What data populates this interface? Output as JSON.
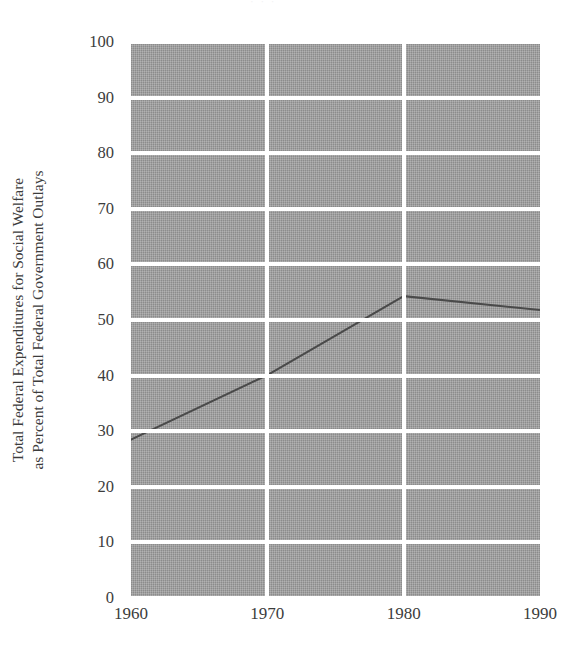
{
  "page": {
    "bleed_text": "· · ·"
  },
  "chart_data": {
    "type": "line",
    "title": "",
    "subtitle": "",
    "xlabel": "",
    "ylabel": "Total Federal Expenditures for Social Welfare as Percent of Total Federal Government Outlays",
    "ylabel_lines": [
      "Total Federal Expenditures for Social Welfare",
      "as Percent of Total Federal Government Outlays"
    ],
    "x": [
      1960,
      1970,
      1980,
      1990
    ],
    "xtick_labels": [
      "1960",
      "1970",
      "1980",
      "1990"
    ],
    "xlim": [
      1960,
      1990
    ],
    "values": [
      28.5,
      40.1,
      54.3,
      51.8
    ],
    "ylim": [
      0,
      100
    ],
    "yticks": [
      100,
      90,
      80,
      70,
      60,
      50,
      40,
      30,
      20,
      10,
      0
    ],
    "ytick_labels": [
      "100",
      "90",
      "80",
      "70",
      "60",
      "50",
      "40",
      "30",
      "20",
      "10",
      "0"
    ],
    "grid": "horizontal-and-vertical",
    "grid_color": "#ffffff",
    "plot_background": "#9b9b9b",
    "series_color": "#4a4a4a",
    "legend": "none",
    "annotations": [],
    "series": [
      {
        "name": "Total Federal Expenditures for Social Welfare as Percent of Total Federal Government Outlays",
        "values": [
          28.5,
          40.1,
          54.3,
          51.8
        ]
      }
    ]
  }
}
